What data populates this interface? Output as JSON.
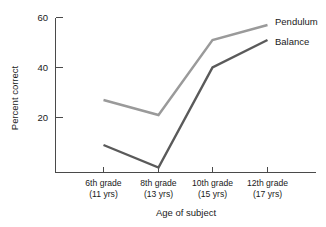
{
  "chart_data": {
    "type": "line",
    "title": "",
    "xlabel": "Age of subject",
    "ylabel": "Percent correct",
    "categories": [
      "6th grade\n(11 yrs)",
      "8th grade\n(13 yrs)",
      "10th grade\n(15 yrs)",
      "12th grade\n(17 yrs)"
    ],
    "category_lines": [
      {
        "top": "6th grade",
        "bottom": "(11 yrs)"
      },
      {
        "top": "8th grade",
        "bottom": "(13 yrs)"
      },
      {
        "top": "10th grade",
        "bottom": "(15 yrs)"
      },
      {
        "top": "12th grade",
        "bottom": "(17 yrs)"
      }
    ],
    "series": [
      {
        "name": "Pendulum",
        "values": [
          27,
          21,
          51,
          57
        ],
        "color": "#9a9a9a"
      },
      {
        "name": "Balance",
        "values": [
          9,
          0,
          40,
          51
        ],
        "color": "#5a5a5a"
      }
    ],
    "yticks": [
      20,
      40,
      60
    ],
    "ytick_labels": [
      "20",
      "40",
      "60"
    ],
    "ylim": [
      0,
      63
    ],
    "xlim": [
      0,
      3
    ],
    "grid": false,
    "legend_position": "right-inline",
    "legend_entries": [
      "Pendulum",
      "Balance"
    ],
    "axis_color": "#4a4a4a"
  }
}
